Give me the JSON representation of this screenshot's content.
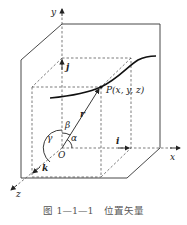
{
  "figure": {
    "caption": "图 1—1—1　位置矢量",
    "labels": {
      "y_axis": "y",
      "x_axis": "x",
      "z_axis": "z",
      "origin": "O",
      "point": "P(x, y, z)",
      "unit_i": "i",
      "unit_j": "j",
      "unit_k": "k",
      "position_vector": "r",
      "angle_alpha": "α",
      "angle_beta": "β",
      "angle_gamma": "γ"
    }
  }
}
